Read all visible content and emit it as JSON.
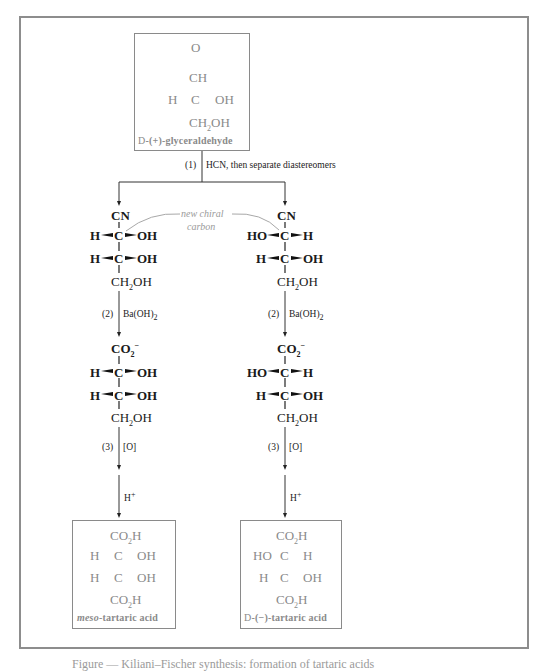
{
  "figure": {
    "caption_partial": "Figure — Kiliani–Fischer synthesis: formation of tartaric acids"
  },
  "start": {
    "name": "D-(+)-glyceraldehyde",
    "name_prefix": "D",
    "name_rest": "-(+)-glyceraldehyde",
    "structure": {
      "top_O": "O",
      "top": "CH",
      "c2_left": "H",
      "c2_center": "C",
      "c2_right": "OH",
      "bottom": "CH2OH"
    }
  },
  "steps": {
    "step1": {
      "number": "(1)",
      "reagent": "HCN, then separate diastereomers"
    },
    "step2": {
      "number": "(2)",
      "reagent": "Ba(OH)2"
    },
    "step3": {
      "number": "(3)",
      "reagent": "[O]"
    },
    "step4": {
      "reagent": "H+"
    }
  },
  "annotation": {
    "line1": "new chiral",
    "line2": "carbon"
  },
  "left_branch": {
    "cyanohydrin": {
      "top": "CN",
      "row1": {
        "left": "H",
        "center": "C",
        "right": "OH"
      },
      "row2": {
        "left": "H",
        "center": "C",
        "right": "OH"
      },
      "bottom": "CH2OH"
    },
    "carboxylate": {
      "top": "CO2−",
      "row1": {
        "left": "H",
        "center": "C",
        "right": "OH"
      },
      "row2": {
        "left": "H",
        "center": "C",
        "right": "OH"
      },
      "bottom": "CH2OH"
    },
    "product": {
      "top": "CO2H",
      "row1": {
        "left": "H",
        "center": "C",
        "right": "OH"
      },
      "row2": {
        "left": "H",
        "center": "C",
        "right": "OH"
      },
      "bottom": "CO2H",
      "name_italic": "meso",
      "name_rest": "-tartaric acid"
    }
  },
  "right_branch": {
    "cyanohydrin": {
      "top": "CN",
      "row1": {
        "left": "HO",
        "center": "C",
        "right": "H"
      },
      "row2": {
        "left": "H",
        "center": "C",
        "right": "OH"
      },
      "bottom": "CH2OH"
    },
    "carboxylate": {
      "top": "CO2−",
      "row1": {
        "left": "HO",
        "center": "C",
        "right": "H"
      },
      "row2": {
        "left": "H",
        "center": "C",
        "right": "OH"
      },
      "bottom": "CH2OH"
    },
    "product": {
      "top": "CO2H",
      "row1": {
        "left": "HO",
        "center": "C",
        "right": "H"
      },
      "row2": {
        "left": "H",
        "center": "C",
        "right": "OH"
      },
      "bottom": "CO2H",
      "name_prefix": "D",
      "name_rest": "-(−)-tartaric acid"
    }
  },
  "colors": {
    "frame": "#8d8d8d",
    "boxed_text": "#8a8a8a",
    "main_text": "#1a1a1a",
    "annotation": "#9a9a9a"
  }
}
